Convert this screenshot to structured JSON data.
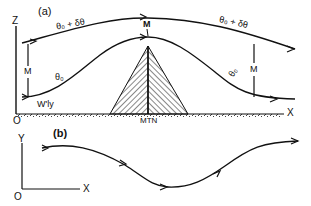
{
  "panel_a": {
    "label": "(a)",
    "axis_z": "Z",
    "axis_x": "X",
    "origin": "O",
    "upper_isentrope": "θ₀ + δθ",
    "upper_isentrope_right": "θ₀ + δθ",
    "lower_isentrope": "θ₀",
    "lower_isentrope_right": "θ₀",
    "mass_left": "M",
    "mass_top": "M",
    "mass_right": "M",
    "flow_label": "W'ly",
    "mountain_label": "MTN"
  },
  "panel_b": {
    "label": "(b)",
    "axis_y": "Y",
    "axis_x": "X",
    "origin": "O"
  },
  "colors": {
    "ink": "#111111",
    "background": "#ffffff"
  }
}
